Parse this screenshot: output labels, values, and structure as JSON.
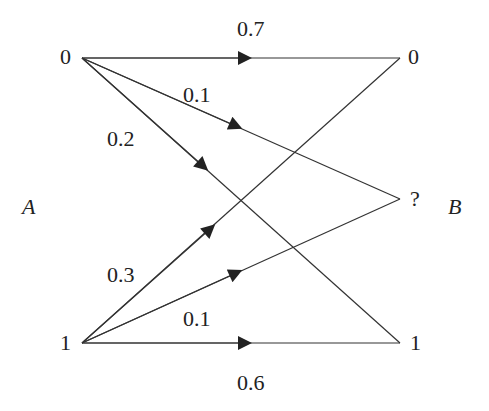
{
  "diagram": {
    "type": "channel-transition-diagram",
    "input_label": "A",
    "output_label": "B",
    "inputs": [
      {
        "symbol": "0",
        "x": 82,
        "y": 58
      },
      {
        "symbol": "1",
        "x": 82,
        "y": 343
      }
    ],
    "outputs": [
      {
        "symbol": "0",
        "x": 400,
        "y": 58
      },
      {
        "symbol": "?",
        "x": 400,
        "y": 199
      },
      {
        "symbol": "1",
        "x": 400,
        "y": 343
      }
    ],
    "edges": [
      {
        "from": "0",
        "to": "0",
        "prob": "0.7"
      },
      {
        "from": "0",
        "to": "?",
        "prob": "0.1"
      },
      {
        "from": "0",
        "to": "1",
        "prob": "0.2"
      },
      {
        "from": "1",
        "to": "0",
        "prob": "0.3"
      },
      {
        "from": "1",
        "to": "?",
        "prob": "0.1"
      },
      {
        "from": "1",
        "to": "1",
        "prob": "0.6"
      }
    ]
  }
}
